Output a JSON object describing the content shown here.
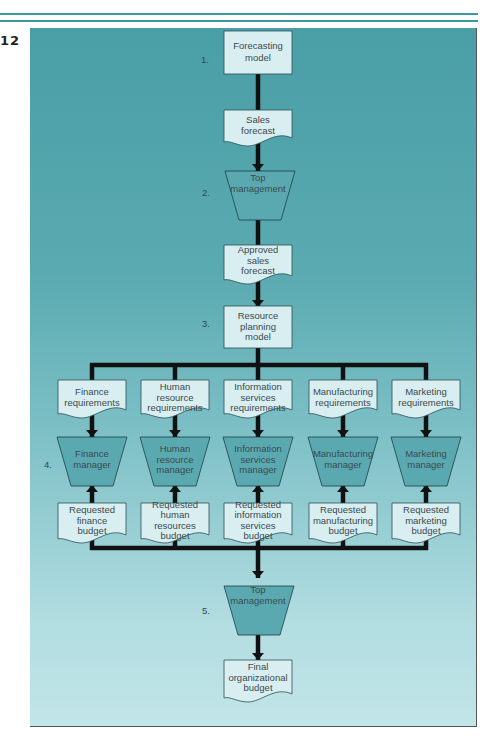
{
  "figure": {
    "number": "12",
    "colors": {
      "panel_top": "#4a9ea6",
      "panel_bottom": "#c2e5e8",
      "box_fill": "#d8eef0",
      "manager_fill": "#5aa9b1",
      "line": "#111111",
      "rule": "#3a9aa0"
    }
  },
  "steps": {
    "s1": "1.",
    "s2": "2.",
    "s3": "3.",
    "s4": "4.",
    "s5": "5."
  },
  "nodes": {
    "forecasting_model": [
      "Forecasting",
      "model"
    ],
    "sales_forecast": [
      "Sales",
      "forecast"
    ],
    "top_management_1": [
      "Top",
      "management"
    ],
    "approved_sales_forecast": [
      "Approved",
      "sales",
      "forecast"
    ],
    "resource_planning_model": [
      "Resource",
      "planning",
      "model"
    ],
    "requirements": [
      [
        "Finance",
        "requirements"
      ],
      [
        "Human",
        "resource",
        "requirements"
      ],
      [
        "Information",
        "services",
        "requirements"
      ],
      [
        "Manufacturing",
        "requirements"
      ],
      [
        "Marketing",
        "requirements"
      ]
    ],
    "managers": [
      [
        "Finance",
        "manager"
      ],
      [
        "Human",
        "resource",
        "manager"
      ],
      [
        "Information",
        "services",
        "manager"
      ],
      [
        "Manufacturing",
        "manager"
      ],
      [
        "Marketing",
        "manager"
      ]
    ],
    "budgets": [
      [
        "Requested",
        "finance",
        "budget"
      ],
      [
        "Requested",
        "human",
        "resources",
        "budget"
      ],
      [
        "Requested",
        "information",
        "services",
        "budget"
      ],
      [
        "Requested",
        "manufacturing",
        "budget"
      ],
      [
        "Requested",
        "marketing",
        "budget"
      ]
    ],
    "top_management_2": [
      "Top",
      "management"
    ],
    "final_budget": [
      "Final",
      "organizational",
      "budget"
    ]
  }
}
